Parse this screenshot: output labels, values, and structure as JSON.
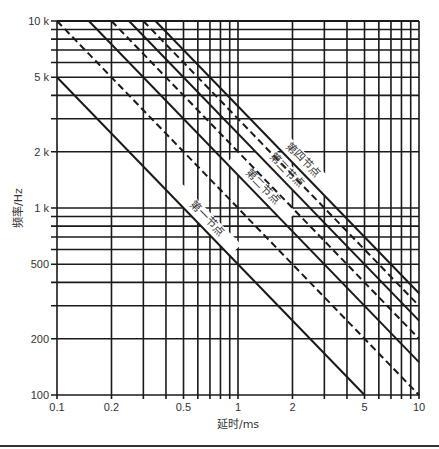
{
  "chart_data": {
    "type": "line",
    "title": "",
    "xlabel": "延时/ms",
    "ylabel": "频率/Hz",
    "x_scale": "log",
    "y_scale": "log",
    "xlim": [
      0.1,
      10
    ],
    "ylim": [
      100,
      10000
    ],
    "grid": true,
    "x_ticks": [
      {
        "value": 0.1,
        "label": "0.1"
      },
      {
        "value": 0.2,
        "label": "0.2"
      },
      {
        "value": 0.5,
        "label": "0.5"
      },
      {
        "value": 1,
        "label": "1"
      },
      {
        "value": 2,
        "label": "2"
      },
      {
        "value": 5,
        "label": "5"
      },
      {
        "value": 10,
        "label": "10"
      }
    ],
    "y_ticks": [
      {
        "value": 100,
        "label": "100"
      },
      {
        "value": 200,
        "label": "200"
      },
      {
        "value": 500,
        "label": "500"
      },
      {
        "value": 1000,
        "label": "1 k"
      },
      {
        "value": 2000,
        "label": "2 k"
      },
      {
        "value": 5000,
        "label": "5 k"
      },
      {
        "value": 10000,
        "label": "10 k"
      }
    ],
    "x_grid": [
      0.1,
      0.2,
      0.3,
      0.4,
      0.5,
      0.6,
      0.7,
      0.8,
      0.9,
      1,
      2,
      3,
      4,
      5,
      6,
      7,
      8,
      9,
      10
    ],
    "y_grid": [
      100,
      200,
      300,
      400,
      500,
      600,
      700,
      800,
      900,
      1000,
      2000,
      3000,
      4000,
      5000,
      6000,
      7000,
      8000,
      9000,
      10000
    ],
    "series": [
      {
        "name": "第一节点",
        "product_f_t": 0.5,
        "style": "solid",
        "labeled": true
      },
      {
        "name": "",
        "product_f_t": 1.0,
        "style": "dashed",
        "labeled": false
      },
      {
        "name": "第二节点",
        "product_f_t": 1.5,
        "style": "solid",
        "labeled": true
      },
      {
        "name": "",
        "product_f_t": 2.0,
        "style": "dashed",
        "labeled": false
      },
      {
        "name": "第三节点",
        "product_f_t": 2.5,
        "style": "solid",
        "labeled": true
      },
      {
        "name": "",
        "product_f_t": 3.0,
        "style": "dashed",
        "labeled": false
      },
      {
        "name": "第四节点",
        "product_f_t": 3.5,
        "style": "solid",
        "labeled": true
      }
    ],
    "series_endpoints": [
      {
        "name": "第一节点",
        "points": [
          [
            0.1,
            5000
          ],
          [
            5,
            100
          ]
        ]
      },
      {
        "name": "dashed-1",
        "points": [
          [
            0.1,
            10000
          ],
          [
            10,
            100
          ]
        ]
      },
      {
        "name": "第二节点",
        "points": [
          [
            0.15,
            10000
          ],
          [
            10,
            150
          ]
        ]
      },
      {
        "name": "dashed-2",
        "points": [
          [
            0.2,
            10000
          ],
          [
            10,
            200
          ]
        ]
      },
      {
        "name": "第三节点",
        "points": [
          [
            0.25,
            10000
          ],
          [
            10,
            250
          ]
        ]
      },
      {
        "name": "dashed-3",
        "points": [
          [
            0.3,
            10000
          ],
          [
            10,
            300
          ]
        ]
      },
      {
        "name": "第四节点",
        "points": [
          [
            0.35,
            10000
          ],
          [
            10,
            350
          ]
        ]
      }
    ],
    "annotations": [
      {
        "text": "第一节点",
        "on_series": 0.5,
        "at_t_ms": 0.62
      },
      {
        "text": "第二节点",
        "on_series": 1.5,
        "at_t_ms": 1.25
      },
      {
        "text": "第三节点",
        "on_series": 2.5,
        "at_t_ms": 1.7
      },
      {
        "text": "第四节点",
        "on_series": 3.5,
        "at_t_ms": 2.1
      }
    ],
    "legend": "none (inline labels along lines)"
  },
  "layout": {
    "plot_left": 57,
    "plot_right": 419,
    "plot_top": 21,
    "plot_bottom": 395,
    "line_color": "#1a1a1a"
  }
}
